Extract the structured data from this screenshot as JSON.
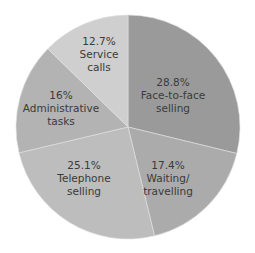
{
  "chart_data": {
    "type": "pie",
    "title": "",
    "start_angle_deg": 0,
    "direction": "clockwise",
    "categories": [
      "Face-to-face selling",
      "Waiting/ travelling",
      "Telephone selling",
      "Administrative tasks",
      "Service calls"
    ],
    "values": [
      28.8,
      17.4,
      25.1,
      16,
      12.7
    ],
    "labels": [
      {
        "pct": "28.8%",
        "line1": "Face-to-face",
        "line2": "selling",
        "color": "#9a9a9a"
      },
      {
        "pct": "17.4%",
        "line1": "Waiting/",
        "line2": "travelling",
        "color": "#ababab"
      },
      {
        "pct": "25.1%",
        "line1": "Telephone",
        "line2": "selling",
        "color": "#bdbdbd"
      },
      {
        "pct": "16%",
        "line1": "Administrative",
        "line2": "tasks",
        "color": "#b3b3b3"
      },
      {
        "pct": "12.7%",
        "line1": "Service",
        "line2": "calls",
        "color": "#cfcfcf"
      }
    ]
  }
}
